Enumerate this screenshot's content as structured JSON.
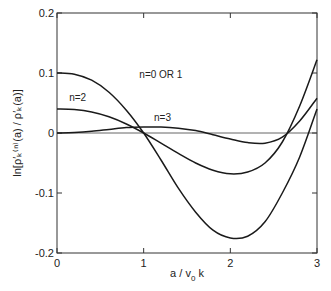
{
  "chart_data": {
    "type": "line",
    "title": "",
    "xlabel": "a/v₀k",
    "ylabel": "ln[ρ′ₖ⁽ⁿ⁾(a) / ρ′ₖ(a)]",
    "xlim": [
      0,
      3
    ],
    "ylim": [
      -0.2,
      0.2
    ],
    "x_ticks": [
      0,
      1,
      2,
      3
    ],
    "x_tick_labels": [
      "0",
      "1",
      "2",
      "3"
    ],
    "y_ticks": [
      0.2,
      0.1,
      0,
      -0.1,
      -0.2
    ],
    "y_tick_labels": [
      "0.2",
      "0.1",
      "0",
      "-0.1",
      "-0.2"
    ],
    "grid": false,
    "zero_line": true,
    "legend": "none (inline annotations)",
    "x": [
      0,
      0.2,
      0.4,
      0.6,
      0.8,
      1.0,
      1.2,
      1.4,
      1.6,
      1.8,
      2.0,
      2.2,
      2.4,
      2.6,
      2.8,
      3.0
    ],
    "series": [
      {
        "name": "n=0 OR 1",
        "annotation": "n=0 OR 1",
        "values": [
          0.1,
          0.098,
          0.088,
          0.068,
          0.038,
          0.0,
          -0.045,
          -0.092,
          -0.132,
          -0.162,
          -0.175,
          -0.172,
          -0.148,
          -0.1,
          -0.04,
          0.04
        ]
      },
      {
        "name": "n=2",
        "annotation": "n=2",
        "values": [
          0.04,
          0.039,
          0.035,
          0.027,
          0.015,
          0.0,
          -0.017,
          -0.034,
          -0.05,
          -0.062,
          -0.068,
          -0.065,
          -0.05,
          -0.015,
          0.045,
          0.122
        ]
      },
      {
        "name": "n=3",
        "annotation": "n=3",
        "values": [
          0.0,
          0.001,
          0.003,
          0.006,
          0.009,
          0.01,
          0.01,
          0.008,
          0.004,
          -0.003,
          -0.01,
          -0.016,
          -0.017,
          -0.007,
          0.02,
          0.058
        ]
      }
    ]
  },
  "labels": {
    "xlabel_main": "a / v",
    "xlabel_sub": "0",
    "xlabel_tail": " k",
    "ylabel_text": "ln[ρ′ₖ⁽ⁿ⁾(a) / ρ′ₖ(a)]"
  }
}
